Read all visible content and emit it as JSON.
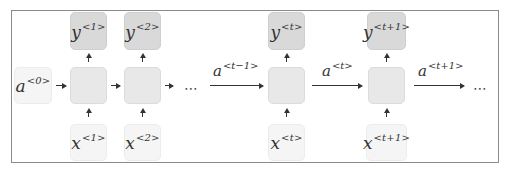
{
  "diagram": {
    "type": "unrolled-rnn",
    "colors": {
      "output_box": "#d9d9d9",
      "hidden_box": "#e8e8e8",
      "input_box": "#f5f5f5",
      "frame_border": "#8a8a8a",
      "arrow": "#333333"
    },
    "initial_state": {
      "base": "a",
      "sup": "<0>"
    },
    "outputs": [
      {
        "base": "y",
        "sup": "<1>"
      },
      {
        "base": "y",
        "sup": "<2>"
      },
      {
        "base": "y",
        "sup": "<t>"
      },
      {
        "base": "y",
        "sup": "<t+1>"
      }
    ],
    "inputs": [
      {
        "base": "x",
        "sup": "<1>"
      },
      {
        "base": "x",
        "sup": "<2>"
      },
      {
        "base": "x",
        "sup": "<t>"
      },
      {
        "base": "x",
        "sup": "<t+1>"
      }
    ],
    "edge_labels": [
      {
        "base": "a",
        "sup": "<t−1>"
      },
      {
        "base": "a",
        "sup": "<t>"
      },
      {
        "base": "a",
        "sup": "<t+1>"
      }
    ],
    "ellipsis": "⋯"
  }
}
